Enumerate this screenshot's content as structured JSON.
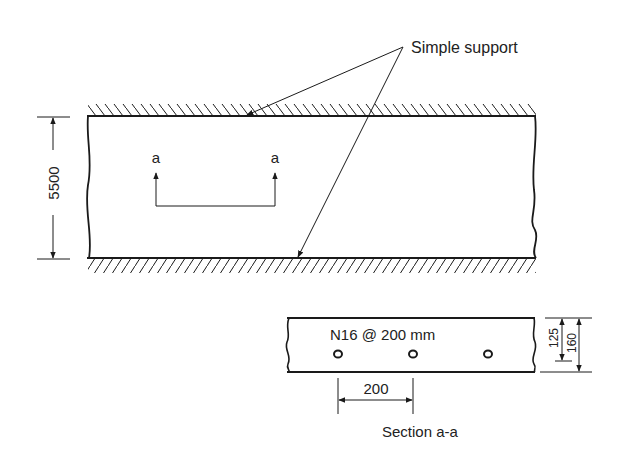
{
  "plan": {
    "support_label": "Simple support",
    "span_dimension": "5500",
    "section_marker_left": "a",
    "section_marker_right": "a"
  },
  "section": {
    "reinforcement_label": "N16 @ 200 mm",
    "bar_spacing_dimension": "200",
    "effective_depth_dimension": "125",
    "slab_thickness_dimension": "160",
    "title": "Section a-a"
  },
  "colors": {
    "line": "#1a1a1a",
    "background": "#ffffff"
  }
}
